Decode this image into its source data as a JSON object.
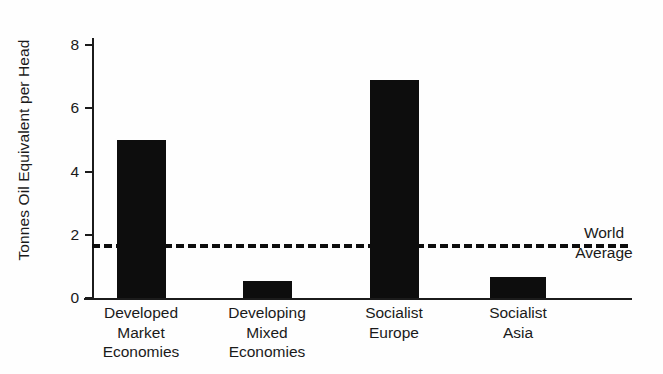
{
  "chart_data": {
    "type": "bar",
    "title": "",
    "xlabel": "",
    "ylabel": "Tonnes Oil Equivalent per Head",
    "ylim": [
      0,
      8.6
    ],
    "grid": false,
    "legend": "none",
    "categories": [
      "Developed Market Economies",
      "Developing Mixed Economies",
      "Socialist Europe",
      "Socialist Asia"
    ],
    "category_lines": [
      [
        "Developed",
        "Market",
        "Economies"
      ],
      [
        "Developing",
        "Mixed",
        "Economies"
      ],
      [
        "Socialist",
        "Europe"
      ],
      [
        "Socialist",
        "Asia"
      ]
    ],
    "values": [
      5.0,
      0.55,
      6.9,
      0.65
    ],
    "y_ticks": [
      0,
      2,
      4,
      6,
      8
    ],
    "y_tick_labels": [
      "0",
      "2",
      "4",
      "6",
      "8"
    ],
    "annotations": [
      {
        "name": "world-average",
        "line_value": 1.7,
        "label_line_1": "World",
        "label_line_2": "Average",
        "style": "dashed"
      }
    ],
    "colors": {
      "bar": "#0d0d0d",
      "axis": "#1b1b1b",
      "text": "#1a1a1a",
      "background": "#fefefe",
      "average_line": "#0d0d0d"
    }
  }
}
